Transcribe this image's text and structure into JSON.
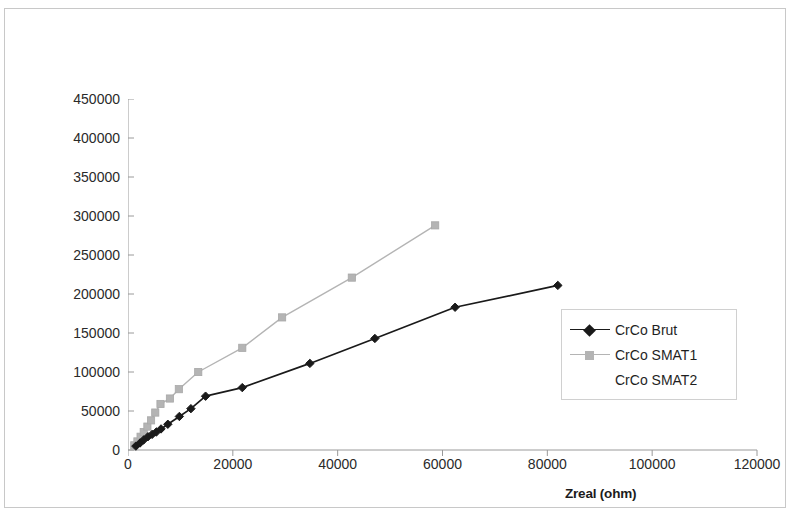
{
  "chart_data": {
    "type": "line",
    "title": "",
    "xlabel": "Zreal (ohm)",
    "ylabel": "-Zimag (ohm)",
    "xlim": [
      0,
      120000
    ],
    "ylim": [
      0,
      450000
    ],
    "x_ticks": [
      0,
      20000,
      40000,
      60000,
      80000,
      100000,
      120000
    ],
    "y_ticks": [
      0,
      50000,
      100000,
      150000,
      200000,
      250000,
      300000,
      350000,
      400000,
      450000
    ],
    "x_tick_labels": [
      "0",
      "20000",
      "40000",
      "60000",
      "80000",
      "100000",
      "120000"
    ],
    "y_tick_labels": [
      "0",
      "50000",
      "100000",
      "150000",
      "200000",
      "250000",
      "300000",
      "350000",
      "400000",
      "450000"
    ],
    "grid": false,
    "legend_position": "right-inside",
    "series": [
      {
        "name": "CrCo Brut",
        "color": "#1a1a1a",
        "marker": "diamond",
        "points": [
          [
            1500,
            5000
          ],
          [
            2300,
            9000
          ],
          [
            3000,
            13000
          ],
          [
            3800,
            17000
          ],
          [
            4600,
            20000
          ],
          [
            5400,
            23000
          ],
          [
            6300,
            27000
          ],
          [
            7600,
            33000
          ],
          [
            9800,
            43000
          ],
          [
            12000,
            53000
          ],
          [
            14800,
            69000
          ],
          [
            21800,
            80000
          ],
          [
            34700,
            111000
          ],
          [
            47100,
            143000
          ],
          [
            62400,
            183000
          ],
          [
            82000,
            211000
          ]
        ]
      },
      {
        "name": "CrCo SMAT1",
        "color": "#b4b4b4",
        "marker": "square",
        "points": [
          [
            1200,
            6000
          ],
          [
            1800,
            11000
          ],
          [
            2400,
            17000
          ],
          [
            3000,
            23000
          ],
          [
            3700,
            30000
          ],
          [
            4400,
            38000
          ],
          [
            5200,
            48000
          ],
          [
            6200,
            59000
          ],
          [
            8000,
            66000
          ],
          [
            9700,
            78000
          ],
          [
            13400,
            100000
          ],
          [
            21800,
            131000
          ],
          [
            29400,
            170000
          ],
          [
            42700,
            221000
          ],
          [
            58600,
            288000
          ]
        ]
      },
      {
        "name": "CrCo SMAT2",
        "color": "#cfcfcf",
        "marker": "none",
        "points": []
      }
    ]
  },
  "legend": {
    "entries": [
      {
        "label": "CrCo Brut"
      },
      {
        "label": "CrCo SMAT1"
      },
      {
        "label": "CrCo SMAT2"
      }
    ]
  }
}
